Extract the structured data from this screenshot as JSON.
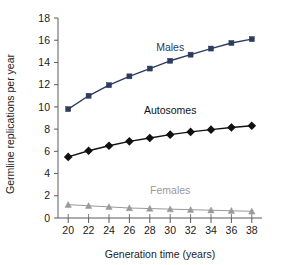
{
  "chart_data": {
    "type": "line",
    "title": "",
    "xlabel": "Generation time (years)",
    "ylabel": "Germline replications per year",
    "x": [
      20,
      22,
      24,
      26,
      28,
      30,
      32,
      34,
      36,
      38
    ],
    "xlim": [
      19,
      39
    ],
    "ylim": [
      0,
      18
    ],
    "xticks": [
      20,
      22,
      24,
      26,
      28,
      30,
      32,
      34,
      36,
      38
    ],
    "yticks": [
      0,
      2,
      4,
      6,
      8,
      10,
      12,
      14,
      16,
      18
    ],
    "xtick_labels": [
      "20",
      "22",
      "24",
      "26",
      "28",
      "30",
      "32",
      "34",
      "36",
      "38"
    ],
    "ytick_labels": [
      "0",
      "2",
      "4",
      "6",
      "8",
      "10",
      "12",
      "14",
      "16",
      "18"
    ],
    "grid": false,
    "legend_position": "inline-annotations",
    "series": [
      {
        "name": "Males",
        "color": "#2d3b5e",
        "marker": "square",
        "values": [
          9.8,
          11.0,
          11.95,
          12.75,
          13.45,
          14.15,
          14.7,
          15.25,
          15.75,
          16.1
        ],
        "label_x": 30,
        "label_y": 15.05
      },
      {
        "name": "Autosomes",
        "color": "#111111",
        "marker": "diamond",
        "values": [
          5.5,
          6.05,
          6.5,
          6.9,
          7.2,
          7.5,
          7.75,
          7.95,
          8.15,
          8.3
        ],
        "label_x": 30,
        "label_y": 9.35
      },
      {
        "name": "Females",
        "color": "#9a9a9a",
        "marker": "triangle",
        "values": [
          1.2,
          1.1,
          1.0,
          0.9,
          0.85,
          0.8,
          0.75,
          0.7,
          0.65,
          0.6
        ],
        "label_x": 30,
        "label_y": 2.15
      }
    ]
  },
  "axes": {
    "x_title": "Generation time (years)",
    "y_title": "Germline replications per year"
  },
  "labels": {
    "males": "Males",
    "autosomes": "Autosomes",
    "females": "Females"
  },
  "colors": {
    "males": "#2d3b5e",
    "autosomes": "#111111",
    "females": "#9a9a9a",
    "axis": "#5a5a5a",
    "background": "#ffffff"
  }
}
